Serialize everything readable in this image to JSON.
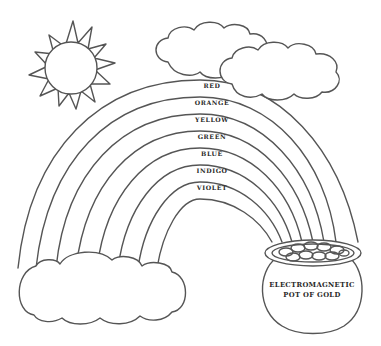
{
  "worksheet": {
    "rainbow": {
      "bands": [
        {
          "label": "RED"
        },
        {
          "label": "ORANGE"
        },
        {
          "label": "YELLOW"
        },
        {
          "label": "GREEN"
        },
        {
          "label": "BLUE"
        },
        {
          "label": "INDIGO"
        },
        {
          "label": "VIOLET"
        }
      ]
    },
    "pot": {
      "line1": "ELECTROMAGNETIC",
      "line2": "POT OF GOLD"
    }
  },
  "colors": {
    "stroke": "#555555",
    "background": "#ffffff",
    "text": "#2a2a2a"
  }
}
